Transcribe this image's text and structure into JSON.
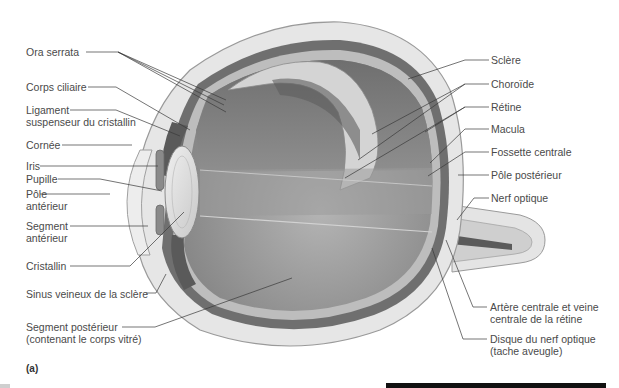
{
  "figure": {
    "panel_label": "(a)"
  },
  "labels_left": [
    {
      "id": "ora-serrata",
      "text": "Ora serrata"
    },
    {
      "id": "corps-ciliaire",
      "text": "Corps ciliaire"
    },
    {
      "id": "ligament-line1",
      "text": "Ligament"
    },
    {
      "id": "ligament-line2",
      "text": "suspenseur du cristallin"
    },
    {
      "id": "cornee",
      "text": "Cornée"
    },
    {
      "id": "iris",
      "text": "Iris"
    },
    {
      "id": "pupille",
      "text": "Pupille"
    },
    {
      "id": "pole-ant-line1",
      "text": "Pôle"
    },
    {
      "id": "pole-ant-line2",
      "text": "antérieur"
    },
    {
      "id": "segment-ant-line1",
      "text": "Segment"
    },
    {
      "id": "segment-ant-line2",
      "text": "antérieur"
    },
    {
      "id": "cristallin",
      "text": "Cristallin"
    },
    {
      "id": "sinus",
      "text": "Sinus veineux de la sclère"
    },
    {
      "id": "segment-post-line1",
      "text": "Segment postérieur"
    },
    {
      "id": "segment-post-line2",
      "text": "(contenant le corps vitré)"
    }
  ],
  "labels_right": [
    {
      "id": "sclere",
      "text": "Sclère"
    },
    {
      "id": "choroide",
      "text": "Choroïde"
    },
    {
      "id": "retine",
      "text": "Rétine"
    },
    {
      "id": "macula",
      "text": "Macula"
    },
    {
      "id": "fossette",
      "text": "Fossette centrale"
    },
    {
      "id": "pole-post",
      "text": "Pôle postérieur"
    },
    {
      "id": "nerf",
      "text": "Nerf optique"
    },
    {
      "id": "artere-line1",
      "text": "Artère centrale et veine"
    },
    {
      "id": "artere-line2",
      "text": "centrale de la rétine"
    },
    {
      "id": "disque-line1",
      "text": "Disque du nerf optique"
    },
    {
      "id": "disque-line2",
      "text": "(tache aveugle)"
    }
  ],
  "colors": {
    "sclera": "#e6e6e6",
    "sclera_edge": "#9a9a9a",
    "choroid": "#6e6e6e",
    "retina": "#bdbdbd",
    "vitreous": "#a9a9a9",
    "vitreous_dark": "#7d7d7d",
    "lens": "#dcdcdc",
    "leader": "#3a3a3a"
  }
}
